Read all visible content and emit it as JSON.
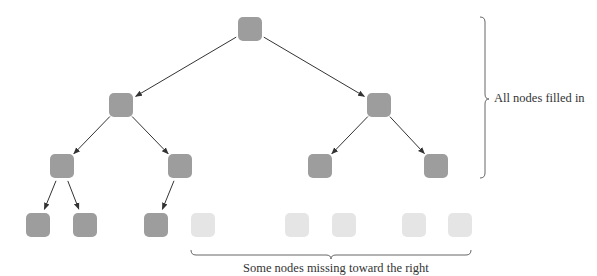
{
  "diagram": {
    "type": "complete-binary-tree",
    "colors": {
      "filled": "#9d9d9d",
      "missing": "#e5e5e5",
      "edge": "#333333",
      "brace": "#666666"
    },
    "node_size": 24,
    "nodes": [
      {
        "id": "n1",
        "x": 238,
        "y": 17,
        "state": "filled"
      },
      {
        "id": "n2",
        "x": 109,
        "y": 93,
        "state": "filled"
      },
      {
        "id": "n3",
        "x": 367,
        "y": 93,
        "state": "filled"
      },
      {
        "id": "n4",
        "x": 50,
        "y": 154,
        "state": "filled"
      },
      {
        "id": "n5",
        "x": 168,
        "y": 154,
        "state": "filled"
      },
      {
        "id": "n6",
        "x": 308,
        "y": 154,
        "state": "filled"
      },
      {
        "id": "n7",
        "x": 424,
        "y": 154,
        "state": "filled"
      },
      {
        "id": "n8",
        "x": 26,
        "y": 213,
        "state": "filled"
      },
      {
        "id": "n9",
        "x": 73,
        "y": 213,
        "state": "filled"
      },
      {
        "id": "n10",
        "x": 144,
        "y": 213,
        "state": "filled"
      },
      {
        "id": "n11",
        "x": 191,
        "y": 213,
        "state": "missing"
      },
      {
        "id": "n12",
        "x": 285,
        "y": 213,
        "state": "missing"
      },
      {
        "id": "n13",
        "x": 332,
        "y": 213,
        "state": "missing"
      },
      {
        "id": "n14",
        "x": 402,
        "y": 213,
        "state": "missing"
      },
      {
        "id": "n15",
        "x": 448,
        "y": 213,
        "state": "missing"
      }
    ],
    "edges": [
      [
        "n1",
        "n2"
      ],
      [
        "n1",
        "n3"
      ],
      [
        "n2",
        "n4"
      ],
      [
        "n2",
        "n5"
      ],
      [
        "n3",
        "n6"
      ],
      [
        "n3",
        "n7"
      ],
      [
        "n4",
        "n8"
      ],
      [
        "n4",
        "n9"
      ],
      [
        "n5",
        "n10"
      ]
    ],
    "annotations": {
      "right_label": "All nodes filled in",
      "bottom_label": "Some nodes missing toward the right"
    }
  }
}
